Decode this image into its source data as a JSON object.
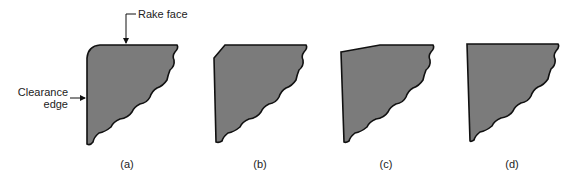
{
  "figure": {
    "annotations": {
      "rake_face": "Rake face",
      "clearance_line1": "Clearance",
      "clearance_line2": "edge"
    },
    "panels": [
      {
        "id": "a",
        "label": "(a)",
        "edge_prep": "rounded (honed) edge"
      },
      {
        "id": "b",
        "label": "(b)",
        "edge_prep": "chamfer"
      },
      {
        "id": "c",
        "label": "(c)",
        "edge_prep": "negative land (T-land)"
      },
      {
        "id": "d",
        "label": "(d)",
        "edge_prep": "sharp edge"
      }
    ],
    "colors": {
      "fill": "#7b7b7b",
      "stroke": "#111111",
      "text": "#222222"
    }
  }
}
